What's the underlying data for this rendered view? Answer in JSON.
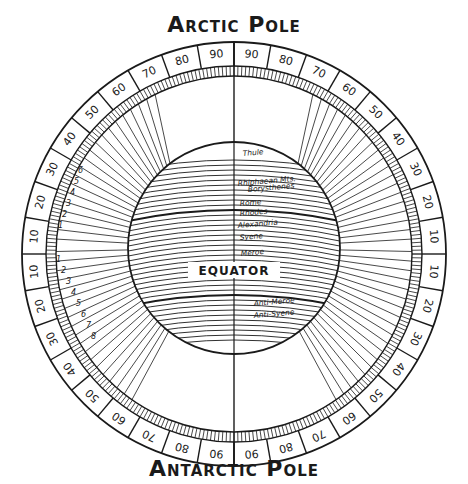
{
  "titles": {
    "top": "Arctic Pole",
    "bottom": "Antarctic Pole"
  },
  "globe": {
    "equator_label": "EQUATOR",
    "north_places": [
      "Thule",
      "Rhiphaean Mts.",
      "Borysthenes",
      "Rome",
      "Rhodes",
      "Alexandria",
      "Syene",
      "Meroe"
    ],
    "south_places": [
      "Anti-Meroe",
      "Anti-Syene"
    ]
  },
  "ring": {
    "degree_labels_upper": [
      "10",
      "20",
      "30",
      "40",
      "50",
      "60",
      "70",
      "80",
      "90"
    ],
    "degree_labels_lower": [
      "10",
      "20",
      "30",
      "40",
      "50",
      "60",
      "70",
      "80",
      "90"
    ],
    "climate_numbers_north": [
      "1",
      "2",
      "3",
      "4",
      "5",
      "6",
      "7",
      "8",
      "9",
      "10",
      "11",
      "12",
      "13",
      "14",
      "15",
      "16",
      "17",
      "18",
      "19",
      "20",
      "21"
    ],
    "climate_numbers_south": [
      "1",
      "2",
      "3",
      "4",
      "5",
      "6",
      "7",
      "8",
      "9",
      "10",
      "11",
      "12"
    ]
  },
  "colors": {
    "ink": "#1a1a1a",
    "paper": "#ffffff"
  }
}
